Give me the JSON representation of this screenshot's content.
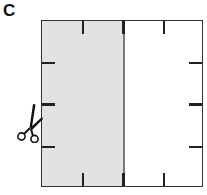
{
  "figure": {
    "panel_label": "C",
    "colors": {
      "shaded_half": "#e2e2e2",
      "border": "#333333",
      "tick": "#222222",
      "fold_line": "#777777"
    },
    "icons": [
      "scissors-icon"
    ]
  }
}
